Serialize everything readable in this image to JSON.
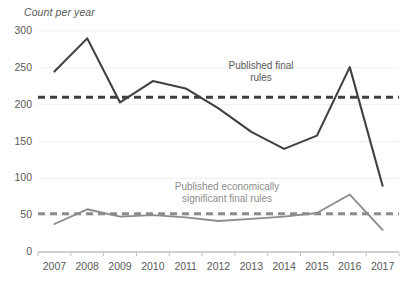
{
  "chart_data": {
    "type": "line",
    "title": "",
    "xlabel": "",
    "ylabel": "Count per year",
    "categories": [
      "2007",
      "2008",
      "2009",
      "2010",
      "2011",
      "2012",
      "2013",
      "2014",
      "2015",
      "2016",
      "2017"
    ],
    "x": [
      2007,
      2008,
      2009,
      2010,
      2011,
      2012,
      2013,
      2014,
      2015,
      2016,
      2017
    ],
    "ylim": [
      0,
      300
    ],
    "y_ticks": [
      0,
      50,
      100,
      150,
      200,
      250,
      300
    ],
    "y_tick_labels": [
      "0",
      "50",
      "100",
      "150",
      "200",
      "250",
      "300"
    ],
    "grid": true,
    "legend": "none",
    "series": [
      {
        "name": "Published final rules",
        "color": "#404040",
        "style": "solid",
        "values": [
          245,
          290,
          203,
          232,
          222,
          195,
          163,
          140,
          158,
          251,
          90
        ]
      },
      {
        "name": "Published economically significant final rules",
        "color": "#8c8c8c",
        "style": "solid",
        "values": [
          38,
          58,
          48,
          50,
          47,
          42,
          45,
          48,
          53,
          78,
          30
        ]
      }
    ],
    "reference_lines": [
      {
        "name": "Published final rules average",
        "color": "#404040",
        "style": "dashed",
        "value": 210
      },
      {
        "name": "Published economically significant final rules average",
        "color": "#8c8c8c",
        "style": "dashed",
        "value": 52
      }
    ],
    "annotations": [
      {
        "name": "upper-annotation",
        "lines": [
          "Published final",
          "rules"
        ],
        "color": "#595959"
      },
      {
        "name": "lower-annotation",
        "lines": [
          "Published economically",
          "significant final rules"
        ],
        "color": "#8c8c8c"
      }
    ]
  },
  "axes": {
    "y_title": "Count per year"
  },
  "colors": {
    "background": "#ffffff",
    "gridline": "#eceff1",
    "axis": "#bfbfbf",
    "tick_text": "#595959",
    "series_dark": "#404040",
    "series_light": "#8c8c8c"
  }
}
